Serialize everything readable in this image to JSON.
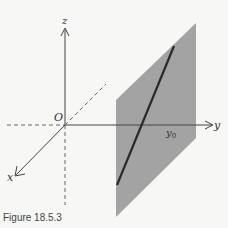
{
  "figure": {
    "caption": "Figure 18.5.3",
    "labels": {
      "z": "z",
      "y": "y",
      "x": "x",
      "origin": "O",
      "y0": "y",
      "y0_sub": "0"
    },
    "colors": {
      "background": "#f7f7f5",
      "plane": "#a3a3a3",
      "axis": "#444444",
      "line": "#2a2a2a"
    }
  }
}
